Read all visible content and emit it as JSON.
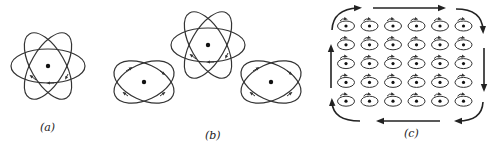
{
  "figure": {
    "panels": [
      {
        "id": "a",
        "label": "(a)",
        "description": "single atom with three orbiting electron loops",
        "center": [
          48,
          66
        ]
      },
      {
        "id": "b",
        "label": "(b)",
        "description": "three neighboring atoms with orbital current loops",
        "centers": [
          [
            144,
            82
          ],
          [
            208,
            45
          ],
          [
            271,
            82
          ]
        ]
      },
      {
        "id": "c",
        "label": "(c)",
        "description": "grid of atomic current loops with net boundary current",
        "rows": 5,
        "cols": 6
      }
    ]
  },
  "colors": {
    "ink": "#333333",
    "background": "#ffffff"
  }
}
